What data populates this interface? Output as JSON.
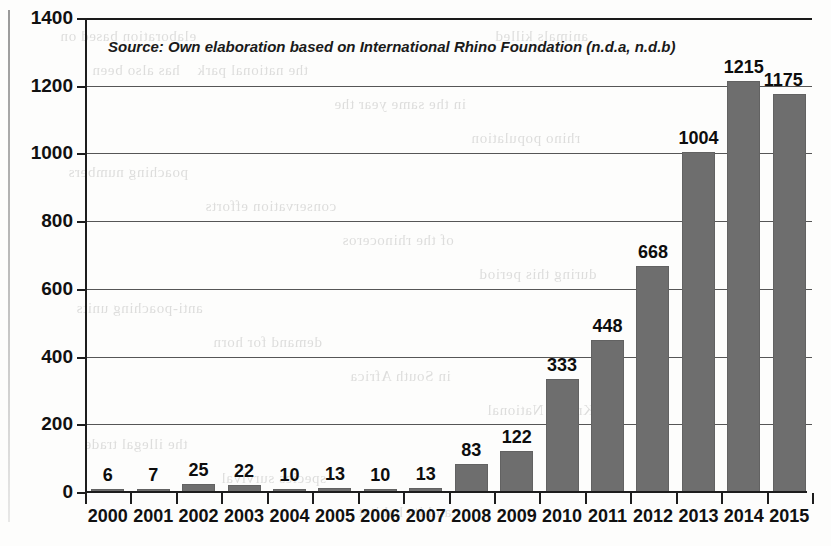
{
  "source_note": "Source: Own elaboration based on International Rhino Foundation (n.d.a, n.d.b)",
  "colors": {
    "bar_fill": "#6e6e6e",
    "axis": "#1d1d1d",
    "gridline": "#565656",
    "text": "#111111",
    "background": "#fdfdfc"
  },
  "bleed_through_text": [
    "elaboration based on",
    "the national park",
    "in the same year the",
    "rhino population",
    "poaching numbers",
    "conservation efforts",
    "of the rhinoceros",
    "during this period",
    "anti-poaching units",
    "demand for horn",
    "in South Africa",
    "Kruger National",
    "the illegal trade",
    "species survival",
    "and its habitat",
    "animals killed",
    "has also been"
  ],
  "chart_data": {
    "type": "bar",
    "title": "",
    "xlabel": "",
    "ylabel": "",
    "categories": [
      "2000",
      "2001",
      "2002",
      "2003",
      "2004",
      "2005",
      "2006",
      "2007",
      "2008",
      "2009",
      "2010",
      "2011",
      "2012",
      "2013",
      "2014",
      "2015"
    ],
    "values": [
      6,
      7,
      25,
      22,
      10,
      13,
      10,
      13,
      83,
      122,
      333,
      448,
      668,
      1004,
      1215,
      1175
    ],
    "data_labels": [
      "6",
      "7",
      "25",
      "22",
      "10",
      "13",
      "10",
      "13",
      "83",
      "122",
      "333",
      "448",
      "668",
      "1004",
      "1215",
      "1175"
    ],
    "ylim": [
      0,
      1400
    ],
    "ytick_labels": [
      "0",
      "200",
      "400",
      "600",
      "800",
      "1000",
      "1200",
      "1400"
    ],
    "ytick_values": [
      0,
      200,
      400,
      600,
      800,
      1000,
      1200,
      1400
    ],
    "grid": true,
    "legend": false,
    "series": [
      {
        "name": "Rhinos poached",
        "values": [
          6,
          7,
          25,
          22,
          10,
          13,
          10,
          13,
          83,
          122,
          333,
          448,
          668,
          1004,
          1215,
          1175
        ]
      }
    ]
  }
}
